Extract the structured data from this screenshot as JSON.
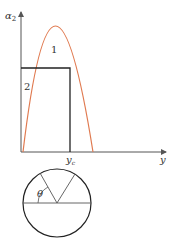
{
  "diagram": {
    "axes": {
      "y_label": "α",
      "y_label_sub": "2",
      "x_label": "y",
      "x_tick_label": "y",
      "x_tick_sub": "c"
    },
    "curves": {
      "curve_1_label": "1",
      "curve_2_label": "2"
    },
    "circle": {
      "angle_label": "θ"
    },
    "colors": {
      "parabola": "#e07a50",
      "lines": "#222222",
      "axis": "#555555"
    }
  }
}
